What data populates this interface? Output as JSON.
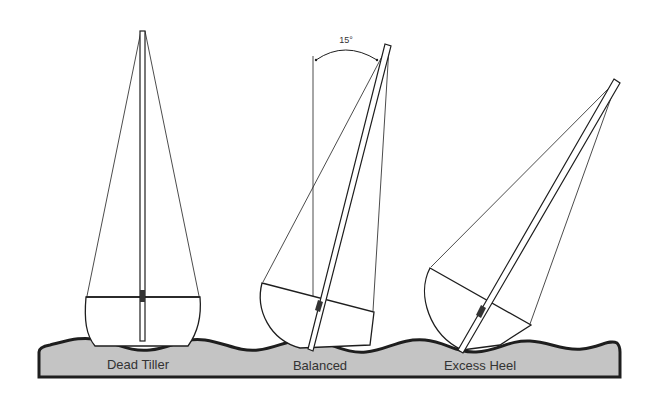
{
  "diagram": {
    "type": "sailboat heel angle comparison",
    "angle_annotation": "15°",
    "boats": [
      {
        "id": "dead-tiller",
        "label": "Dead Tiller",
        "heel_deg": 0
      },
      {
        "id": "balanced",
        "label": "Balanced",
        "heel_deg": 15
      },
      {
        "id": "excess-heel",
        "label": "Excess Heel",
        "heel_deg": 30
      }
    ],
    "colors": {
      "water_fill": "#c4c4c4",
      "outline": "#1e1e1e",
      "background": "#ffffff",
      "text": "#333333"
    }
  }
}
